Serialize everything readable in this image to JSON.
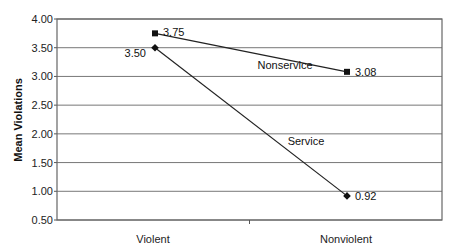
{
  "chart_data": {
    "type": "line",
    "title": "",
    "xlabel": "",
    "ylabel": "Mean Violations",
    "categories": [
      "Violent",
      "Nonviolent"
    ],
    "ylim": [
      0.5,
      4.0
    ],
    "yticks": [
      "4.00",
      "3.50",
      "3.00",
      "2.50",
      "2.00",
      "1.50",
      "1.00",
      "0.50"
    ],
    "grid": true,
    "legend": "none (inline series labels)",
    "series": [
      {
        "name": "Nonservice",
        "marker": "square",
        "values": [
          3.75,
          3.08
        ],
        "labels": [
          "3.75",
          "3.08"
        ]
      },
      {
        "name": "Service",
        "marker": "diamond",
        "values": [
          3.5,
          0.92
        ],
        "labels": [
          "3.50",
          "0.92"
        ]
      }
    ]
  },
  "colors": {
    "line": "#222222",
    "grid": "#777777",
    "frame": "#666666"
  }
}
